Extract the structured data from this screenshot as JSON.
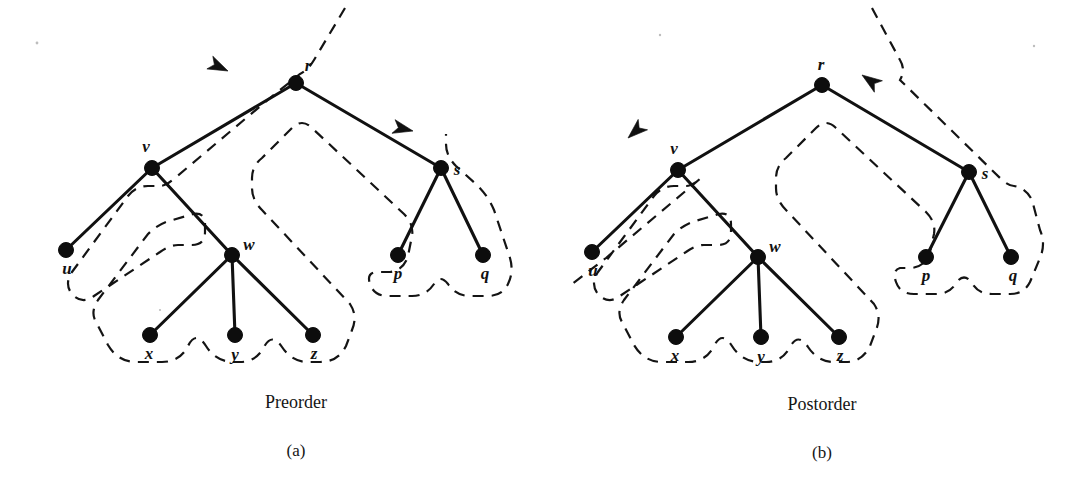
{
  "figure": {
    "kind": "euler-tour-traversal-diagram",
    "background_color": "#ffffff",
    "ink_color": "#111111"
  },
  "panels": [
    {
      "id": "a",
      "caption": "Preorder",
      "subcaption": "(a)",
      "traversal_direction": "counterclockwise",
      "arrows": [
        {
          "name": "root-arrow",
          "direction": "left-down",
          "near_node": "r"
        },
        {
          "name": "right-subtree-arrow",
          "direction": "left",
          "near_node": "s"
        }
      ],
      "nodes": [
        {
          "id": "r",
          "label": "r",
          "x": 296,
          "y": 83,
          "label_dx": 12,
          "label_dy": -12
        },
        {
          "id": "v",
          "label": "v",
          "x": 152,
          "y": 168,
          "label_dx": -6,
          "label_dy": -16
        },
        {
          "id": "s",
          "label": "s",
          "x": 441,
          "y": 168,
          "label_dx": 16,
          "label_dy": 7
        },
        {
          "id": "u",
          "label": "u",
          "x": 66,
          "y": 250,
          "label_dx": 1,
          "label_dy": 24
        },
        {
          "id": "w",
          "label": "w",
          "x": 232,
          "y": 255,
          "label_dx": 17,
          "label_dy": -5
        },
        {
          "id": "p",
          "label": "p",
          "x": 398,
          "y": 255,
          "label_dx": 0,
          "label_dy": 24
        },
        {
          "id": "q",
          "label": "q",
          "x": 483,
          "y": 255,
          "label_dx": 2,
          "label_dy": 24
        },
        {
          "id": "x",
          "label": "x",
          "x": 150,
          "y": 335,
          "label_dx": -1,
          "label_dy": 24
        },
        {
          "id": "y",
          "label": "y",
          "x": 235,
          "y": 335,
          "label_dx": 0,
          "label_dy": 25
        },
        {
          "id": "z",
          "label": "z",
          "x": 313,
          "y": 335,
          "label_dx": 1,
          "label_dy": 24
        }
      ],
      "edges": [
        {
          "from": "r",
          "to": "v"
        },
        {
          "from": "r",
          "to": "s"
        },
        {
          "from": "v",
          "to": "u"
        },
        {
          "from": "v",
          "to": "w"
        },
        {
          "from": "s",
          "to": "p"
        },
        {
          "from": "s",
          "to": "q"
        },
        {
          "from": "w",
          "to": "x"
        },
        {
          "from": "w",
          "to": "y"
        },
        {
          "from": "w",
          "to": "z"
        }
      ],
      "caption_x": 296,
      "caption_y": 408,
      "subcaption_x": 296,
      "subcaption_y": 456
    },
    {
      "id": "b",
      "caption": "Postorder",
      "subcaption": "(b)",
      "traversal_direction": "counterclockwise",
      "arrows": [
        {
          "name": "root-arrow",
          "direction": "right-down",
          "near_node": "r"
        },
        {
          "name": "left-subtree-arrow",
          "direction": "up-right",
          "near_node": "v"
        }
      ],
      "nodes": [
        {
          "id": "r",
          "label": "r",
          "x": 822,
          "y": 85,
          "label_dx": -1,
          "label_dy": -15
        },
        {
          "id": "v",
          "label": "v",
          "x": 678,
          "y": 170,
          "label_dx": -4,
          "label_dy": -16
        },
        {
          "id": "s",
          "label": "s",
          "x": 969,
          "y": 172,
          "label_dx": 16,
          "label_dy": 7
        },
        {
          "id": "u",
          "label": "u",
          "x": 592,
          "y": 252,
          "label_dx": 1,
          "label_dy": 24
        },
        {
          "id": "w",
          "label": "w",
          "x": 758,
          "y": 257,
          "label_dx": 17,
          "label_dy": -5
        },
        {
          "id": "p",
          "label": "p",
          "x": 926,
          "y": 257,
          "label_dx": 0,
          "label_dy": 24
        },
        {
          "id": "q",
          "label": "q",
          "x": 1011,
          "y": 257,
          "label_dx": 2,
          "label_dy": 24
        },
        {
          "id": "x",
          "label": "x",
          "x": 676,
          "y": 337,
          "label_dx": -1,
          "label_dy": 24
        },
        {
          "id": "y",
          "label": "y",
          "x": 761,
          "y": 337,
          "label_dx": 0,
          "label_dy": 25
        },
        {
          "id": "z",
          "label": "z",
          "x": 839,
          "y": 337,
          "label_dx": 1,
          "label_dy": 24
        }
      ],
      "edges": [
        {
          "from": "r",
          "to": "v"
        },
        {
          "from": "r",
          "to": "s"
        },
        {
          "from": "v",
          "to": "u"
        },
        {
          "from": "v",
          "to": "w"
        },
        {
          "from": "s",
          "to": "p"
        },
        {
          "from": "s",
          "to": "q"
        },
        {
          "from": "w",
          "to": "x"
        },
        {
          "from": "w",
          "to": "y"
        },
        {
          "from": "w",
          "to": "z"
        }
      ],
      "caption_x": 822,
      "caption_y": 410,
      "subcaption_x": 822,
      "subcaption_y": 458
    }
  ],
  "geometry": {
    "node_radius": 7.5,
    "tour_paths": {
      "panel_a": "M 345 8 L 314 60 Q 308 70 300 74 L 270 98 L 175 178 Q 166 186 160 186 L 148 186 Q 136 186 128 196 L 72 272 Q 64 284 72 294 Q 82 305 94 296 L 160 252 Q 170 245 178 245 L 192 245 Q 205 245 205 232 L 205 224 Q 205 212 193 214 L 166 222 Q 156 226 148 234 L 98 300 Q 90 312 96 322 L 108 345 Q 118 362 136 362 L 162 362 Q 180 362 188 346 Q 196 330 206 346 Q 216 362 234 362 L 240 362 Q 256 362 264 347 Q 272 332 282 347 Q 292 362 308 362 L 320 362 Q 338 362 346 346 L 352 330 Q 358 316 350 304 L 262 210 Q 252 200 252 188 L 252 178 Q 252 166 262 158 L 292 128 Q 302 118 312 128 L 404 214 Q 414 224 412 236 L 408 256 Q 404 270 390 272 L 378 272 Q 366 272 370 284 Q 374 296 388 296 L 412 296 Q 426 296 434 284 Q 440 274 448 284 Q 456 296 470 296 L 488 296 Q 502 296 508 284 Q 514 272 510 258 L 494 210 Q 488 196 478 186 L 456 166 Q 446 156 446 144 L 446 134",
      "panel_b": "M 872 8 L 900 60 Q 906 70 900 80 L 1000 178 Q 1008 186 1014 186 Q 1026 188 1032 200 L 1040 230 Q 1046 244 1040 258 L 1030 282 Q 1024 294 1010 294 L 992 294 Q 978 294 972 283 Q 964 272 956 283 Q 950 294 936 294 L 914 294 Q 900 294 896 282 Q 892 270 900 268 L 912 268 Q 926 266 930 252 L 934 234 Q 936 222 926 212 L 836 128 Q 826 118 816 128 L 786 158 Q 776 166 776 178 L 776 188 Q 776 200 786 210 L 874 304 Q 882 316 876 330 L 870 346 Q 862 362 846 362 L 834 362 Q 818 362 808 347 Q 798 332 790 347 Q 782 362 766 362 L 760 362 Q 742 362 732 346 Q 722 330 714 346 Q 706 362 688 362 L 662 362 Q 644 362 634 345 L 622 322 Q 616 312 624 300 L 674 234 Q 682 226 692 222 L 719 214 Q 731 212 731 224 L 731 232 Q 731 245 718 245 L 704 245 Q 696 245 686 252 L 620 296 Q 608 305 598 294 Q 590 284 598 272 L 654 196 Q 662 186 674 186 L 686 186 Q 692 186 701 178 L 606 258 L 572 284",
      "arrow_a_root": {
        "tip_x": 228,
        "tip_y": 71,
        "angle": 205
      },
      "arrow_a_sub": {
        "tip_x": 413,
        "tip_y": 131,
        "angle": 193
      },
      "arrow_b_root": {
        "tip_x": 862,
        "tip_y": 75,
        "angle": 35
      },
      "arrow_b_sub": {
        "tip_x": 628,
        "tip_y": 138,
        "angle": 318
      }
    }
  }
}
